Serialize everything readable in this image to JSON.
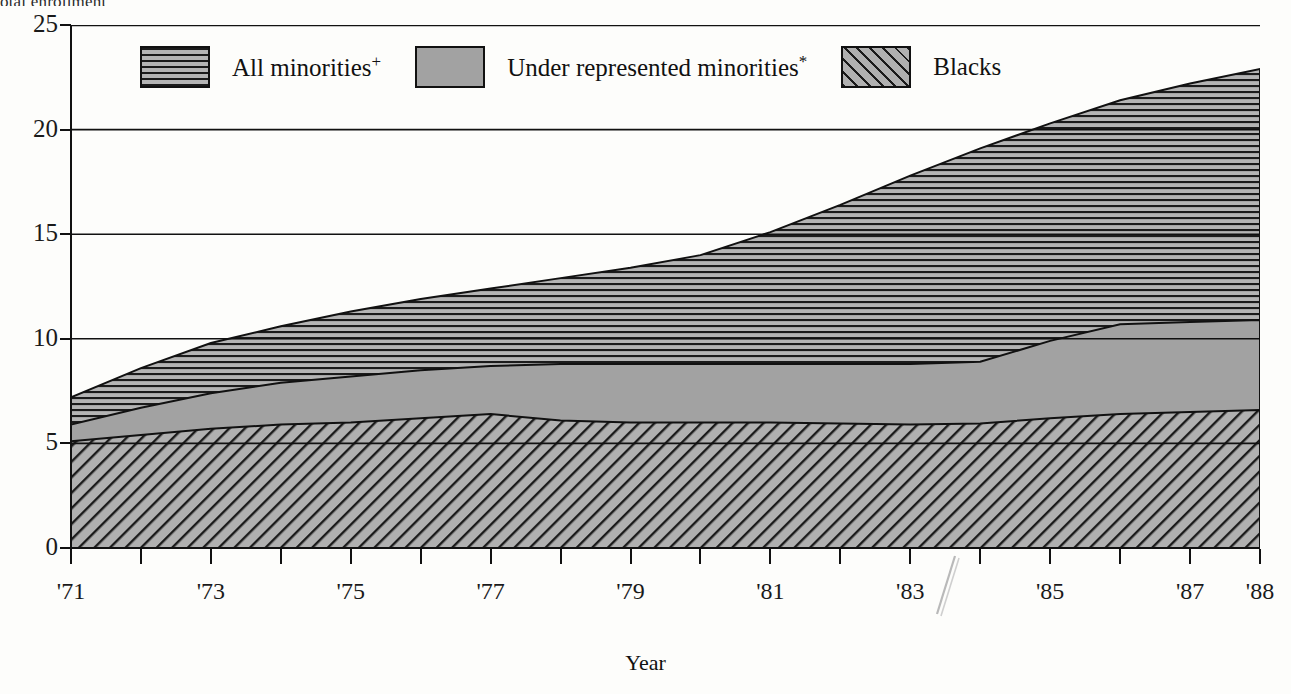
{
  "clipped_top_text": "otal enrollment",
  "axis": {
    "y_label": "",
    "y_ticks": [
      "25",
      "20",
      "15",
      "10",
      "5",
      "0"
    ],
    "x_title": "Year",
    "x_tick_labels": [
      "'71",
      "",
      "'73",
      "",
      "'75",
      "",
      "'77",
      "",
      "'79",
      "",
      "'81",
      "",
      "'83",
      "",
      "'85",
      "",
      "'87",
      "'88"
    ]
  },
  "legend": [
    {
      "label": "All minorities",
      "sup": "+",
      "swatch": "horizontal-hatch-swatch",
      "color": "#1b1b1b"
    },
    {
      "label": "Under represented minorities",
      "sup": "*",
      "swatch": "solid-gray-swatch",
      "color": "#a2a2a2"
    },
    {
      "label": "Blacks",
      "sup": "",
      "swatch": "diagonal-hatch-swatch",
      "color": "#1b1b1b"
    }
  ],
  "chart_data": {
    "type": "area",
    "title": "",
    "subtitle": "",
    "xlabel": "Year",
    "ylabel": "",
    "xlim": [
      1971,
      1988
    ],
    "ylim": [
      0,
      25
    ],
    "grid": true,
    "legend_position": "top-inside",
    "x": [
      1971,
      1972,
      1973,
      1974,
      1975,
      1976,
      1977,
      1978,
      1979,
      1980,
      1981,
      1982,
      1983,
      1984,
      1985,
      1986,
      1987,
      1988
    ],
    "x_tick_labels": [
      "'71",
      "'72",
      "'73",
      "'74",
      "'75",
      "'76",
      "'77",
      "'78",
      "'79",
      "'80",
      "'81",
      "'82",
      "'83",
      "'84",
      "'85",
      "'86",
      "'87",
      "'88"
    ],
    "series": [
      {
        "name": "All minorities",
        "fill": "horizontal-hatch",
        "values": [
          7.2,
          8.6,
          9.8,
          10.6,
          11.3,
          11.9,
          12.4,
          12.9,
          13.4,
          14.0,
          15.1,
          16.4,
          17.8,
          19.1,
          20.3,
          21.4,
          22.2,
          22.9
        ]
      },
      {
        "name": "Under represented minorities",
        "fill": "solid-gray",
        "values": [
          5.9,
          6.7,
          7.4,
          7.9,
          8.2,
          8.5,
          8.7,
          8.8,
          8.8,
          8.8,
          8.8,
          8.8,
          8.8,
          8.9,
          9.9,
          10.7,
          10.8,
          10.9
        ]
      },
      {
        "name": "Blacks",
        "fill": "diagonal-hatch",
        "values": [
          5.1,
          5.4,
          5.7,
          5.9,
          6.0,
          6.2,
          6.4,
          6.1,
          6.0,
          6.0,
          6.0,
          5.95,
          5.9,
          5.95,
          6.2,
          6.4,
          6.5,
          6.6
        ]
      }
    ],
    "notes": [
      "+ superscript marks All minorities",
      "* superscript marks Under represented minorities"
    ]
  }
}
